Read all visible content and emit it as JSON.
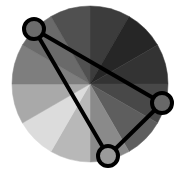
{
  "diagram": {
    "type": "color-wheel-harmony",
    "wheel": {
      "center": [
        90,
        84
      ],
      "radius": 78,
      "segments": [
        {
          "start_deg": -90,
          "end_deg": -60,
          "color": "#3c3c3c"
        },
        {
          "start_deg": -60,
          "end_deg": -30,
          "color": "#262626"
        },
        {
          "start_deg": -30,
          "end_deg": 0,
          "color": "#333333"
        },
        {
          "start_deg": 0,
          "end_deg": 30,
          "color": "#484848"
        },
        {
          "start_deg": 30,
          "end_deg": 60,
          "color": "#5e5e5e"
        },
        {
          "start_deg": 60,
          "end_deg": 90,
          "color": "#8a8a8a"
        },
        {
          "start_deg": 90,
          "end_deg": 120,
          "color": "#b8b8b8"
        },
        {
          "start_deg": 120,
          "end_deg": 150,
          "color": "#dcdcdc"
        },
        {
          "start_deg": 150,
          "end_deg": 180,
          "color": "#a9a9a9"
        },
        {
          "start_deg": 180,
          "end_deg": 210,
          "color": "#7e7e7e"
        },
        {
          "start_deg": 210,
          "end_deg": 240,
          "color": "#6a6a6a"
        },
        {
          "start_deg": 240,
          "end_deg": 270,
          "color": "#505050"
        }
      ]
    },
    "triangle": {
      "stroke": "#000000",
      "stroke_width": 4,
      "nodes": [
        {
          "name": "node-top-left",
          "x": 34,
          "y": 29,
          "r": 10,
          "fill": "#6b6b6b"
        },
        {
          "name": "node-right",
          "x": 162,
          "y": 103,
          "r": 10,
          "fill": "#686868"
        },
        {
          "name": "node-bottom",
          "x": 108,
          "y": 156,
          "r": 10,
          "fill": "#9a9a9a"
        }
      ]
    }
  }
}
